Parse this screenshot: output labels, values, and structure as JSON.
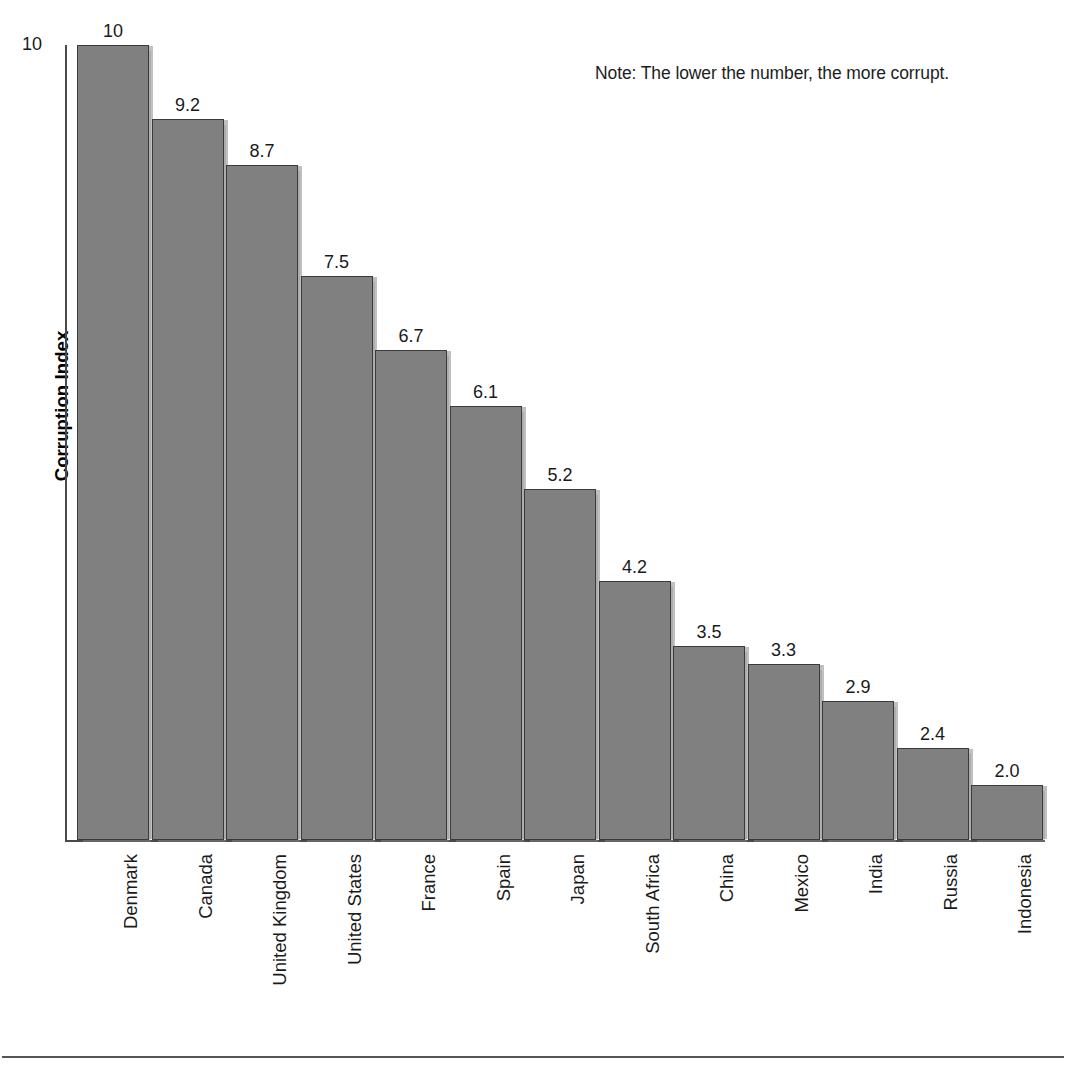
{
  "note": {
    "text": "Note: The lower the number, the more corrupt."
  },
  "axes": {
    "y_title": "Corruption Index",
    "y_tick_label": "10"
  },
  "chart_data": {
    "type": "bar",
    "title": "",
    "xlabel": "",
    "ylabel": "Corruption Index",
    "ylim": [
      1.4,
      10
    ],
    "grid": false,
    "legend": "none",
    "annotations": [
      "Note: The lower the number, the more corrupt."
    ],
    "ytick_labels": [
      "10"
    ],
    "bar_color": "#808080",
    "bar_edge_color": "#3b3b3b",
    "categories": [
      "Denmark",
      "Canada",
      "United Kingdom",
      "United States",
      "France",
      "Spain",
      "Japan",
      "South Africa",
      "China",
      "Mexico",
      "India",
      "Russia",
      "Indonesia"
    ],
    "values": [
      10,
      9.2,
      8.7,
      7.5,
      6.7,
      6.1,
      5.2,
      4.2,
      3.5,
      3.3,
      2.9,
      2.4,
      2.0
    ],
    "value_labels": [
      "10",
      "9.2",
      "8.7",
      "7.5",
      "6.7",
      "6.1",
      "5.2",
      "4.2",
      "3.5",
      "3.3",
      "2.9",
      "2.4",
      "2.0"
    ]
  }
}
